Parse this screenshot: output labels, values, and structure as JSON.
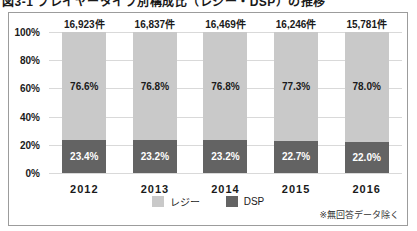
{
  "title_partial": "図3-1 プレイヤータイプ別構成比（レジー・DSP）の推移",
  "chart_data": {
    "type": "bar",
    "variant": "stacked-100-percent",
    "categories": [
      "2012",
      "2013",
      "2014",
      "2015",
      "2016"
    ],
    "totals": [
      "16,923件",
      "16,837件",
      "16,469件",
      "16,246件",
      "15,781件"
    ],
    "series": [
      {
        "name": "レジー",
        "color": "#c9c9c9",
        "label_color": "#1a1a1a",
        "values": [
          76.6,
          76.8,
          76.8,
          77.3,
          78.0
        ],
        "labels": [
          "76.6%",
          "76.8%",
          "76.8%",
          "77.3%",
          "78.0%"
        ]
      },
      {
        "name": "DSP",
        "color": "#636363",
        "label_color": "#ffffff",
        "values": [
          23.4,
          23.2,
          23.2,
          22.7,
          22.0
        ],
        "labels": [
          "23.4%",
          "23.2%",
          "23.2%",
          "22.7%",
          "22.0%"
        ]
      }
    ],
    "y_ticks": [
      "100%",
      "80%",
      "60%",
      "40%",
      "20%",
      "0%"
    ],
    "ylim": [
      0,
      100
    ],
    "grid": true,
    "legend_position": "bottom-center",
    "footnote": "※無回答データ除く",
    "frame_border_color": "#9c9c9c",
    "gridline_color": "#d9d9d9"
  }
}
